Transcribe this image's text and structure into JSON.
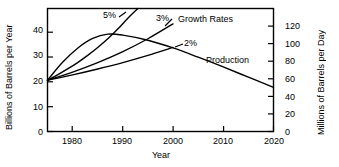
{
  "chart_data": {
    "type": "line",
    "title": "",
    "xlabel": "Year",
    "ylabel": "Billions of Barrels per Year",
    "ylabel_right": "Millions of Barrels per Day",
    "xlim": [
      1975,
      2020
    ],
    "ylim": [
      0,
      48
    ],
    "ylim_right": [
      0,
      141
    ],
    "xticks": [
      1980,
      1990,
      2000,
      2010,
      2020
    ],
    "yticks": [
      0,
      10,
      20,
      30,
      40
    ],
    "yticks_right": [
      0,
      20,
      40,
      60,
      80,
      100,
      120
    ],
    "grid": false,
    "legend_position": "inline-annotations",
    "annotations": [
      {
        "text": "5%",
        "x": 1988,
        "y": 46
      },
      {
        "text": "3%",
        "x": 1999,
        "y": 45
      },
      {
        "text": "Growth Rates",
        "x": 2005,
        "y": 44
      },
      {
        "text": "2%",
        "x": 2002,
        "y": 36
      },
      {
        "text": "Production",
        "x": 2010,
        "y": 31
      }
    ],
    "series": [
      {
        "name": "5%",
        "label": "5%",
        "x": [
          1975,
          1977,
          1979,
          1981,
          1983,
          1985,
          1987,
          1989,
          1991,
          1993
        ],
        "values": [
          20.0,
          22.1,
          24.4,
          26.9,
          29.7,
          32.8,
          36.2,
          40.0,
          44.2,
          48.0
        ]
      },
      {
        "name": "3%",
        "label": "3%",
        "x": [
          1975,
          1980,
          1985,
          1990,
          1995,
          2000
        ],
        "values": [
          20.0,
          23.2,
          26.9,
          31.2,
          36.2,
          42.0
        ]
      },
      {
        "name": "2%",
        "label": "2%",
        "x": [
          1975,
          1980,
          1985,
          1990,
          1995,
          2000
        ],
        "values": [
          20.0,
          22.1,
          24.4,
          26.9,
          29.7,
          32.8
        ]
      },
      {
        "name": "Production",
        "label": "Production",
        "x": [
          1975,
          1978,
          1981,
          1984,
          1987,
          1990,
          1995,
          2000,
          2005,
          2010,
          2015,
          2020
        ],
        "values": [
          20.0,
          27.0,
          32.5,
          36.3,
          38.0,
          37.6,
          35.6,
          32.6,
          29.0,
          25.2,
          21.2,
          17.2
        ]
      }
    ]
  },
  "axes": {
    "left_title": "Billions of Barrels per Year",
    "right_title": "Millions of Barrels per Day",
    "bottom_title": "Year",
    "left_ticks": [
      "0",
      "10",
      "20",
      "30",
      "40"
    ],
    "right_ticks": [
      "0",
      "20",
      "40",
      "60",
      "80",
      "100",
      "120"
    ],
    "bottom_ticks": [
      "1980",
      "1990",
      "2000",
      "2010",
      "2020"
    ]
  },
  "labels": {
    "rate5": "5%",
    "rate3": "3%",
    "rate2": "2%",
    "growth_rates": "Growth Rates",
    "production": "Production"
  }
}
